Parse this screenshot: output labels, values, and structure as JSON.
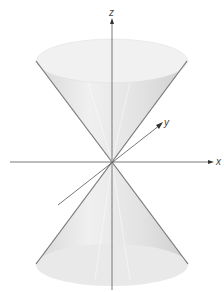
{
  "diagram": {
    "type": "double-cone",
    "axes": {
      "z": "z",
      "y": "y",
      "x": "x"
    },
    "colors": {
      "surface": "#e4e4e4",
      "edge": "#777777",
      "axis": "#555555"
    }
  }
}
